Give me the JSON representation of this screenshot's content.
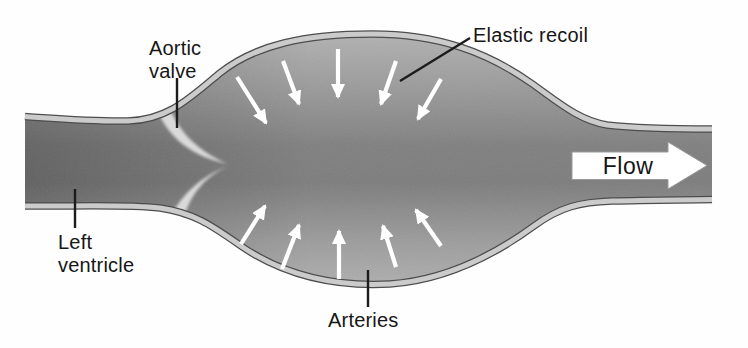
{
  "figure": {
    "labels": {
      "aortic_valve": {
        "line1": "Aortic",
        "line2": "valve"
      },
      "left_ventricle": {
        "line1": "Left",
        "line2": "ventricle"
      },
      "elastic_recoil": "Elastic recoil",
      "arteries": "Arteries",
      "flow": "Flow"
    },
    "colors": {
      "background": "#ffffff",
      "vessel_center": "#7d7d7d",
      "vessel_edge": "#b5b5b5",
      "wall_outline": "#4d4d4d",
      "wall_band": "#cbcbcb",
      "valve_leaflet": "#dadada",
      "recoil_arrow": "#ffffff",
      "flow_arrow_fill": "#ffffff",
      "label_text": "#161616"
    },
    "recoil_arrows": [
      {
        "x1": 237,
        "y1": 77,
        "x2": 266,
        "y2": 123
      },
      {
        "x1": 283,
        "y1": 61,
        "x2": 299,
        "y2": 104
      },
      {
        "x1": 338,
        "y1": 49,
        "x2": 338,
        "y2": 97
      },
      {
        "x1": 396,
        "y1": 61,
        "x2": 381,
        "y2": 104
      },
      {
        "x1": 441,
        "y1": 79,
        "x2": 418,
        "y2": 119
      },
      {
        "x1": 241,
        "y1": 244,
        "x2": 265,
        "y2": 206
      },
      {
        "x1": 282,
        "y1": 269,
        "x2": 299,
        "y2": 225
      },
      {
        "x1": 339,
        "y1": 279,
        "x2": 339,
        "y2": 231
      },
      {
        "x1": 396,
        "y1": 267,
        "x2": 383,
        "y2": 226
      },
      {
        "x1": 441,
        "y1": 246,
        "x2": 416,
        "y2": 210
      }
    ],
    "pointer_lines": [
      {
        "for": "aortic-valve",
        "x1": 177,
        "y1": 78,
        "x2": 177,
        "y2": 128
      },
      {
        "for": "elastic-recoil",
        "x1": 470,
        "y1": 38,
        "x2": 400,
        "y2": 81
      },
      {
        "for": "left-ventricle",
        "x1": 75,
        "y1": 189,
        "x2": 75,
        "y2": 228
      },
      {
        "for": "arteries",
        "x1": 368,
        "y1": 270,
        "x2": 368,
        "y2": 307
      }
    ]
  }
}
